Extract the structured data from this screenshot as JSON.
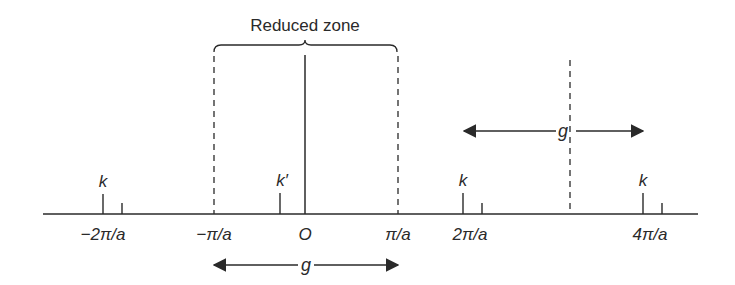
{
  "title": "Reduced zone",
  "axis": {
    "ticks": [
      {
        "label": "−2π/a",
        "x": 103
      },
      {
        "label": "−π/a",
        "x": 214
      },
      {
        "label": "O",
        "x": 305
      },
      {
        "label": "π/a",
        "x": 398
      },
      {
        "label": "2π/a",
        "x": 468
      },
      {
        "label": "4π/a",
        "x": 648
      }
    ]
  },
  "points": [
    {
      "label": "k",
      "x": 103
    },
    {
      "label": "k′",
      "x": 280
    },
    {
      "label": "k",
      "x": 463
    },
    {
      "label": "k",
      "x": 643
    }
  ],
  "arrows": [
    {
      "label": "g",
      "from": "2π/a",
      "to": "4π/a"
    },
    {
      "label": "g",
      "from": "−π/a",
      "to": "π/a"
    }
  ],
  "colors": {
    "ink": "#2a2a2a",
    "background": "#ffffff"
  }
}
